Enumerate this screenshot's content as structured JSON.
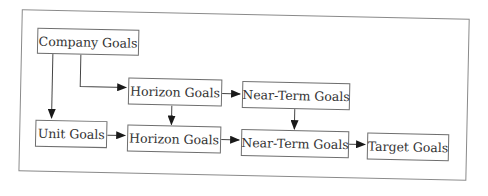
{
  "diagram": {
    "type": "flowchart",
    "nodes": {
      "company": "Company Goals",
      "horizon_top": "Horizon Goals",
      "nearterm_top": "Near-Term Goals",
      "unit": "Unit Goals",
      "horizon_bottom": "Horizon Goals",
      "nearterm_bottom": "Near-Term Goals",
      "target": "Target Goals"
    },
    "edges": [
      {
        "from": "Company Goals",
        "to": "Horizon Goals (top)"
      },
      {
        "from": "Company Goals",
        "to": "Unit Goals"
      },
      {
        "from": "Horizon Goals (top)",
        "to": "Near-Term Goals (top)"
      },
      {
        "from": "Horizon Goals (top)",
        "to": "Horizon Goals (bottom)"
      },
      {
        "from": "Near-Term Goals (top)",
        "to": "Near-Term Goals (bottom)"
      },
      {
        "from": "Unit Goals",
        "to": "Horizon Goals (bottom)"
      },
      {
        "from": "Horizon Goals (bottom)",
        "to": "Near-Term Goals (bottom)"
      },
      {
        "from": "Near-Term Goals (bottom)",
        "to": "Target Goals"
      }
    ],
    "colors": {
      "line": "#1a1a1a",
      "border": "#6e6e6e",
      "frame": "#8a8a8a",
      "text": "#333333"
    }
  }
}
